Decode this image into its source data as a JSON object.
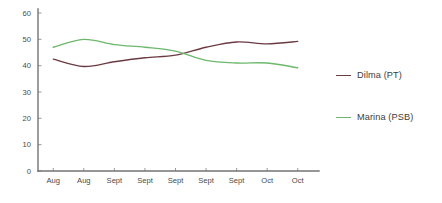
{
  "chart_data": {
    "type": "line",
    "title": "",
    "xlabel": "",
    "ylabel": "",
    "ylim": [
      0,
      60
    ],
    "yticks": [
      0,
      10,
      20,
      30,
      40,
      50,
      60
    ],
    "grid": false,
    "legend_position": "right",
    "categories": [
      "Aug",
      "Aug",
      "Sept",
      "Sept",
      "Sept",
      "Sept",
      "Sept",
      "Oct",
      "Oct"
    ],
    "series": [
      {
        "name": "Dilma (PT)",
        "color": "#6b3a42",
        "values": [
          42.5,
          39.7,
          41.5,
          43.0,
          44.0,
          47.0,
          49.0,
          48.3,
          49.2
        ]
      },
      {
        "name": "Marina (PSB)",
        "color": "#6cb86c",
        "values": [
          47.0,
          50.0,
          48.0,
          47.0,
          45.5,
          42.0,
          41.0,
          41.0,
          39.2
        ]
      }
    ]
  },
  "axis": {
    "y_tick_labels": [
      "60",
      "50",
      "40",
      "30",
      "20",
      "10",
      "0"
    ],
    "x_tick_labels": [
      "Aug",
      "Aug",
      "Sept",
      "Sept",
      "Sept",
      "Sept",
      "Sept",
      "Oct",
      "Oct"
    ]
  },
  "legend": {
    "items": [
      {
        "label": "Dilma (PT)",
        "color": "#6b3a42"
      },
      {
        "label": "Marina (PSB)",
        "color": "#6cb86c"
      }
    ]
  },
  "colors": {
    "background": "#ffffff",
    "axis": "#737373",
    "tick_text": "#4a4a4a",
    "series_dilma": "#6b3a42",
    "series_marina": "#6cb86c"
  }
}
